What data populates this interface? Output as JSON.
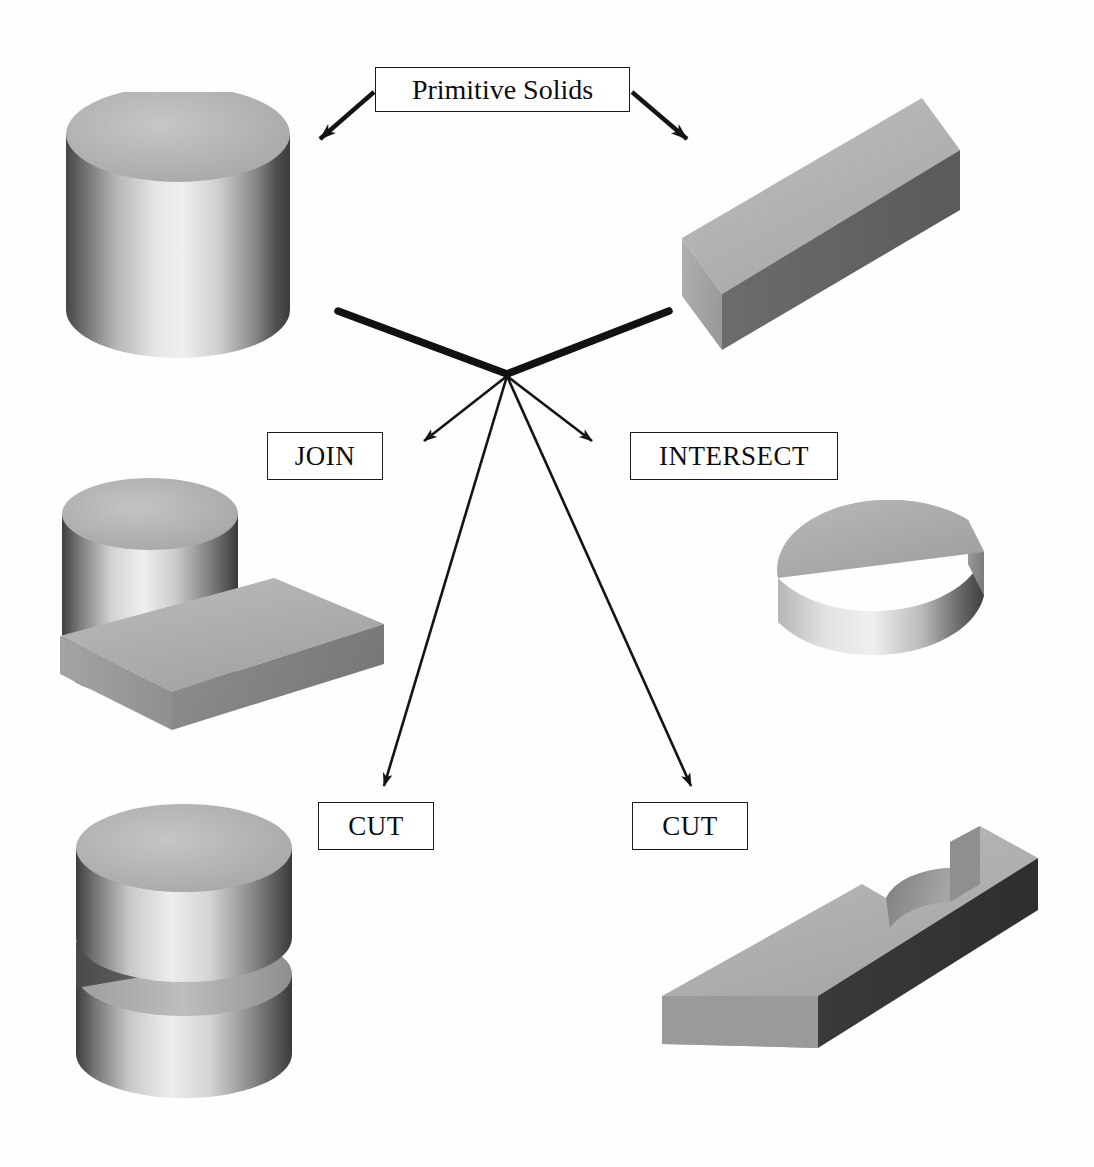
{
  "diagram": {
    "title": "Primitive Solids",
    "background_color": "#fefefe",
    "line_color": "#1a1a1a"
  },
  "nodes": {
    "root": {
      "label": "Primitive Solids",
      "id": "primitive-solids"
    },
    "operations": [
      {
        "id": "join",
        "label": "JOIN"
      },
      {
        "id": "intersect",
        "label": "INTERSECT"
      },
      {
        "id": "cut-left",
        "label": "CUT"
      },
      {
        "id": "cut-right",
        "label": "CUT"
      }
    ]
  },
  "solids": {
    "cylinder": {
      "name": "cylinder-primitive",
      "role": "input primitive",
      "shape": "cylinder"
    },
    "box": {
      "name": "box-primitive",
      "role": "input primitive",
      "shape": "rectangular block"
    },
    "join_result": {
      "name": "join-result-solid",
      "role": "union of cylinder and box",
      "shape": "cylinder merged with block"
    },
    "intersect_result": {
      "name": "intersect-result-solid",
      "role": "intersection of cylinder and box",
      "shape": "half-cylinder wedge"
    },
    "cut_cylinder_result": {
      "name": "cut-cylinder-result-solid",
      "role": "cylinder minus box",
      "shape": "cylinder with horizontal slot"
    },
    "cut_box_result": {
      "name": "cut-box-result-solid",
      "role": "box minus cylinder",
      "shape": "block with cylindrical notch"
    }
  },
  "palette": {
    "top_light": "#bdbdbd",
    "top_mid": "#a9a9a9",
    "face_mid": "#8f8f8f",
    "face_dark": "#5d5d5d",
    "face_darkest": "#3f3f3f",
    "highlight": "#efefef",
    "shadow": "#4a4a4a",
    "outline": "#1a1a1a"
  }
}
